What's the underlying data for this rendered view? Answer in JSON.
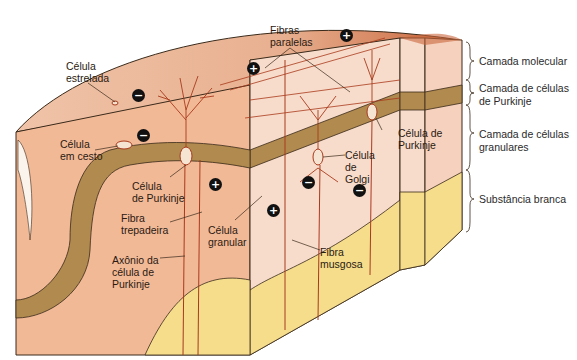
{
  "layers": [
    {
      "label": "Camada molecular",
      "color": "#f6d7c6"
    },
    {
      "label": "Camada de células\nde Purkinje",
      "color": "#b08a4e"
    },
    {
      "label": "Camada de células\ngranulares",
      "color": "#f3cdb7"
    },
    {
      "label": "Substância branca",
      "color": "#f5dd8c"
    }
  ],
  "labels": {
    "celula_estrelada": "Célula\nestrelada",
    "fibras_paralelas": "Fibras\nparalelas",
    "celula_em_cesto": "Célula\nem cesto",
    "celula_purkinje_left": "Célula\nde Purkinje",
    "fibra_trepadeira": "Fibra\ntrepadeira",
    "axonio": "Axônio da\ncélula de\nPurkinje",
    "celula_granular": "Célula\ngranular",
    "celula_golgi": "Célula\nde\nGolgi",
    "celula_purkinje_right": "Célula de\nPurkinje",
    "fibra_musgosa": "Fibra\nmusgosa"
  },
  "signs": {
    "plus": "+",
    "minus": "−"
  },
  "colors": {
    "neuron": "#a83a1c",
    "outline": "#3a2a1a",
    "surface_top": "#e3a27d",
    "surface_dark": "#c7653a"
  }
}
